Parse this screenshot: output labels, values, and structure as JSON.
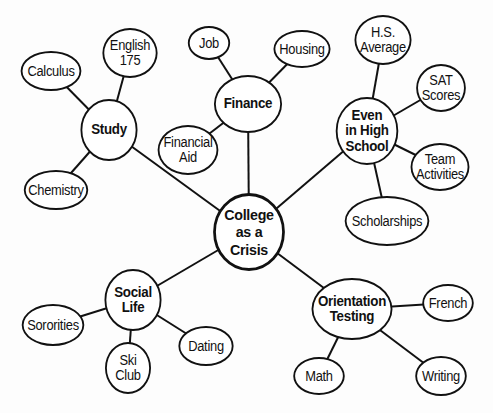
{
  "diagram": {
    "type": "mind-map",
    "center": {
      "id": "crisis",
      "label": "College\nas a\nCrisis",
      "x": 249,
      "y": 232,
      "rx": 39,
      "ry": 39
    },
    "nodes": [
      {
        "id": "study",
        "label": "Study",
        "kind": "hub",
        "x": 109,
        "y": 130,
        "rx": 31,
        "ry": 31
      },
      {
        "id": "calculus",
        "label": "Calculus",
        "kind": "leaf",
        "x": 51,
        "y": 71,
        "rx": 33,
        "ry": 20
      },
      {
        "id": "english",
        "label": "English\n175",
        "kind": "leaf",
        "x": 130,
        "y": 53,
        "rx": 30,
        "ry": 25
      },
      {
        "id": "chemistry",
        "label": "Chemistry",
        "kind": "leaf",
        "x": 56,
        "y": 190,
        "rx": 35,
        "ry": 20
      },
      {
        "id": "finance",
        "label": "Finance",
        "kind": "hub",
        "x": 248,
        "y": 104,
        "rx": 37,
        "ry": 29
      },
      {
        "id": "job",
        "label": "Job",
        "kind": "leaf",
        "x": 209,
        "y": 43,
        "rx": 23,
        "ry": 17
      },
      {
        "id": "housing",
        "label": "Housing",
        "kind": "leaf",
        "x": 302,
        "y": 49,
        "rx": 31,
        "ry": 19
      },
      {
        "id": "finaid",
        "label": "Financial\nAid",
        "kind": "leaf",
        "x": 188,
        "y": 150,
        "rx": 33,
        "ry": 25
      },
      {
        "id": "highschool",
        "label": "Even\nin High\nSchool",
        "kind": "hub",
        "x": 367,
        "y": 131,
        "rx": 34,
        "ry": 34
      },
      {
        "id": "hsavg",
        "label": "H.S.\nAverage",
        "kind": "leaf",
        "x": 383,
        "y": 40,
        "rx": 31,
        "ry": 25
      },
      {
        "id": "sat",
        "label": "SAT\nScores",
        "kind": "leaf",
        "x": 441,
        "y": 88,
        "rx": 27,
        "ry": 24
      },
      {
        "id": "team",
        "label": "Team\nActivities",
        "kind": "leaf",
        "x": 440,
        "y": 167,
        "rx": 32,
        "ry": 24
      },
      {
        "id": "scholar",
        "label": "Scholarships",
        "kind": "leaf",
        "x": 387,
        "y": 221,
        "rx": 46,
        "ry": 25
      },
      {
        "id": "social",
        "label": "Social\nLife",
        "kind": "hub",
        "x": 133,
        "y": 300,
        "rx": 31,
        "ry": 31
      },
      {
        "id": "sororities",
        "label": "Sororities",
        "kind": "leaf",
        "x": 53,
        "y": 325,
        "rx": 34,
        "ry": 21
      },
      {
        "id": "ski",
        "label": "Ski\nClub",
        "kind": "leaf",
        "x": 128,
        "y": 368,
        "rx": 25,
        "ry": 26
      },
      {
        "id": "dating",
        "label": "Dating",
        "kind": "leaf",
        "x": 206,
        "y": 346,
        "rx": 30,
        "ry": 20
      },
      {
        "id": "orientation",
        "label": "Orientation\nTesting",
        "kind": "hub",
        "x": 352,
        "y": 309,
        "rx": 44,
        "ry": 31
      },
      {
        "id": "french",
        "label": "French",
        "kind": "leaf",
        "x": 448,
        "y": 303,
        "rx": 28,
        "ry": 19
      },
      {
        "id": "math",
        "label": "Math",
        "kind": "leaf",
        "x": 319,
        "y": 376,
        "rx": 28,
        "ry": 19
      },
      {
        "id": "writing",
        "label": "Writing",
        "kind": "leaf",
        "x": 441,
        "y": 376,
        "rx": 28,
        "ry": 20
      }
    ],
    "edges": [
      [
        "crisis",
        "study"
      ],
      [
        "crisis",
        "finance"
      ],
      [
        "crisis",
        "highschool"
      ],
      [
        "crisis",
        "social"
      ],
      [
        "crisis",
        "orientation"
      ],
      [
        "study",
        "calculus"
      ],
      [
        "study",
        "english"
      ],
      [
        "study",
        "chemistry"
      ],
      [
        "finance",
        "job"
      ],
      [
        "finance",
        "housing"
      ],
      [
        "finance",
        "finaid"
      ],
      [
        "highschool",
        "hsavg"
      ],
      [
        "highschool",
        "sat"
      ],
      [
        "highschool",
        "team"
      ],
      [
        "highschool",
        "scholar"
      ],
      [
        "social",
        "sororities"
      ],
      [
        "social",
        "ski"
      ],
      [
        "social",
        "dating"
      ],
      [
        "orientation",
        "french"
      ],
      [
        "orientation",
        "math"
      ],
      [
        "orientation",
        "writing"
      ]
    ],
    "colors": {
      "stroke": "#111111",
      "fill": "#ffffff",
      "background": "#fdfdfd"
    }
  }
}
